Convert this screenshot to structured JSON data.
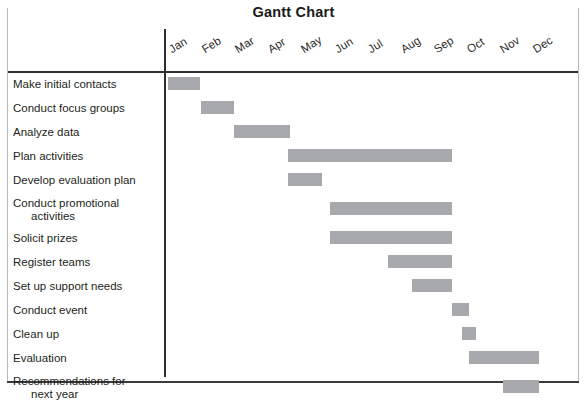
{
  "title": "Gantt Chart",
  "axis": {
    "months": [
      "Jan",
      "Feb",
      "Mar",
      "Apr",
      "May",
      "Jun",
      "Jul",
      "Aug",
      "Sep",
      "Oct",
      "Nov",
      "Dec"
    ],
    "bar_color": "#a7a9ac",
    "axis_color": "#2e2e2e"
  },
  "tasks": [
    {
      "label": "Make initial contacts",
      "line2": "",
      "start": "Jan",
      "end": "Jan"
    },
    {
      "label": "Conduct focus groups",
      "line2": "",
      "start": "Feb",
      "end": "Feb"
    },
    {
      "label": "Analyze data",
      "line2": "",
      "start": "Mar",
      "end": "Apr"
    },
    {
      "label": "Plan activities",
      "line2": "",
      "start": "May",
      "end": "Sep"
    },
    {
      "label": "Develop evaluation plan",
      "line2": "",
      "start": "May",
      "end": "May"
    },
    {
      "label": "Conduct promotional",
      "line2": "activities",
      "start": "Jun",
      "end": "Sep"
    },
    {
      "label": "Solicit prizes",
      "line2": "",
      "start": "Jun",
      "end": "Sep"
    },
    {
      "label": "Register teams",
      "line2": "",
      "start": "Aug",
      "end": "Sep"
    },
    {
      "label": "Set up support needs",
      "line2": "",
      "start": "Sep",
      "end": "Sep"
    },
    {
      "label": "Conduct event",
      "line2": "",
      "start": "Oct",
      "end": "Oct"
    },
    {
      "label": "Clean up",
      "line2": "",
      "start": "Oct",
      "end": "Oct"
    },
    {
      "label": "Evaluation",
      "line2": "",
      "start": "Nov",
      "end": "Dec"
    },
    {
      "label": "Recommendations for",
      "line2": "next year",
      "start": "Dec",
      "end": "Dec"
    }
  ],
  "chart_data": {
    "type": "bar",
    "title": "Gantt Chart",
    "xlabel": "",
    "ylabel": "",
    "orientation": "horizontal",
    "categories": [
      "Make initial contacts",
      "Conduct focus groups",
      "Analyze data",
      "Plan activities",
      "Develop evaluation plan",
      "Conduct promotional activities",
      "Solicit prizes",
      "Register teams",
      "Set up support needs",
      "Conduct event",
      "Clean up",
      "Evaluation",
      "Recommendations for next year"
    ],
    "x_tick_labels": [
      "Jan",
      "Feb",
      "Mar",
      "Apr",
      "May",
      "Jun",
      "Jul",
      "Aug",
      "Sep",
      "Oct",
      "Nov",
      "Dec"
    ],
    "xlim": [
      0,
      12
    ],
    "grid": false,
    "legend": "none",
    "bars": [
      {
        "task": "Make initial contacts",
        "start_month": 0,
        "end_month": 1,
        "start_label": "Jan",
        "end_label": "Jan",
        "duration_months": 1
      },
      {
        "task": "Conduct focus groups",
        "start_month": 1,
        "end_month": 2,
        "start_label": "Feb",
        "end_label": "Feb",
        "duration_months": 1
      },
      {
        "task": "Analyze data",
        "start_month": 2,
        "end_month": 3.7,
        "start_label": "Mar",
        "end_label": "mid-Apr",
        "duration_months": 1.7
      },
      {
        "task": "Plan activities",
        "start_month": 3.7,
        "end_month": 8.6,
        "start_label": "late-Apr",
        "end_label": "Sep",
        "duration_months": 4.9
      },
      {
        "task": "Develop evaluation plan",
        "start_month": 3.7,
        "end_month": 4.7,
        "start_label": "late-Apr",
        "end_label": "May",
        "duration_months": 1
      },
      {
        "task": "Conduct promotional activities",
        "start_month": 5,
        "end_month": 8.6,
        "start_label": "Jun",
        "end_label": "Sep",
        "duration_months": 3.6
      },
      {
        "task": "Solicit prizes",
        "start_month": 5,
        "end_month": 8.6,
        "start_label": "Jun",
        "end_label": "Sep",
        "duration_months": 3.6
      },
      {
        "task": "Register teams",
        "start_month": 6.7,
        "end_month": 8.6,
        "start_label": "Aug",
        "end_label": "Sep",
        "duration_months": 1.9
      },
      {
        "task": "Set up support needs",
        "start_month": 7.4,
        "end_month": 8.6,
        "start_label": "Sep",
        "end_label": "Sep",
        "duration_months": 1.2
      },
      {
        "task": "Conduct event",
        "start_month": 8.6,
        "end_month": 9.1,
        "start_label": "Oct",
        "end_label": "Oct",
        "duration_months": 0.5
      },
      {
        "task": "Clean up",
        "start_month": 8.9,
        "end_month": 9.3,
        "start_label": "Oct",
        "end_label": "Oct",
        "duration_months": 0.4
      },
      {
        "task": "Evaluation",
        "start_month": 9.1,
        "end_month": 11.2,
        "start_label": "Nov",
        "end_label": "Dec",
        "duration_months": 2.1
      },
      {
        "task": "Recommendations for next year",
        "start_month": 10.1,
        "end_month": 11.2,
        "start_label": "Dec",
        "end_label": "Dec",
        "duration_months": 1.1
      }
    ]
  },
  "geometry": {
    "axis_x_px": 166,
    "month_width_px": 33.1,
    "label_x_px": 168,
    "bar_px": [
      {
        "left": 168,
        "width": 32
      },
      {
        "left": 201,
        "width": 33
      },
      {
        "left": 234,
        "width": 56
      },
      {
        "left": 288,
        "width": 164
      },
      {
        "left": 288,
        "width": 34
      },
      {
        "left": 330,
        "width": 122
      },
      {
        "left": 330,
        "width": 122
      },
      {
        "left": 388,
        "width": 64
      },
      {
        "left": 412,
        "width": 40
      },
      {
        "left": 452,
        "width": 17
      },
      {
        "left": 462,
        "width": 14
      },
      {
        "left": 469,
        "width": 70
      },
      {
        "left": 503,
        "width": 36
      }
    ]
  }
}
